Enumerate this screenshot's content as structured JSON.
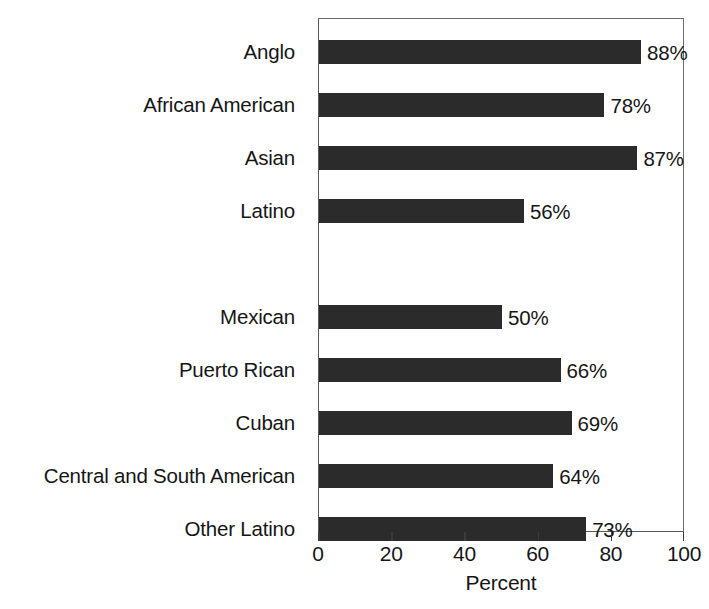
{
  "chart_data": {
    "type": "bar",
    "orientation": "horizontal",
    "title": "",
    "subtitle": "",
    "xlabel": "Percent",
    "ylabel": "",
    "xlim": [
      0,
      100
    ],
    "xticks": [
      0,
      20,
      40,
      60,
      80,
      100
    ],
    "xticklabels": [
      "0",
      "20",
      "40",
      "60",
      "80",
      "100"
    ],
    "grid": false,
    "legend": false,
    "bar_color": "#2b2b2b",
    "frame_color": "#5a5a5a",
    "text_color": "#161616",
    "categories": [
      "Anglo",
      "African American",
      "Asian",
      "Latino",
      "",
      "Mexican",
      "Puerto Rican",
      "Cuban",
      "Central and South American",
      "Other Latino"
    ],
    "values": [
      88,
      78,
      87,
      56,
      null,
      50,
      66,
      69,
      64,
      73
    ],
    "value_labels": [
      "88%",
      "78%",
      "87%",
      "56%",
      "",
      "50%",
      "66%",
      "69%",
      "64%",
      "73%"
    ],
    "rows": [
      {
        "label": "Anglo",
        "value": 88,
        "value_label": "88%",
        "slot": 0,
        "has_bar": true
      },
      {
        "label": "African American",
        "value": 78,
        "value_label": "78%",
        "slot": 1,
        "has_bar": true
      },
      {
        "label": "Asian",
        "value": 87,
        "value_label": "87%",
        "slot": 2,
        "has_bar": true
      },
      {
        "label": "Latino",
        "value": 56,
        "value_label": "56%",
        "slot": 3,
        "has_bar": true
      },
      {
        "label": "",
        "value": null,
        "value_label": "",
        "slot": 4,
        "has_bar": false
      },
      {
        "label": "Mexican",
        "value": 50,
        "value_label": "50%",
        "slot": 5,
        "has_bar": true
      },
      {
        "label": "Puerto Rican",
        "value": 66,
        "value_label": "66%",
        "slot": 6,
        "has_bar": true
      },
      {
        "label": "Cuban",
        "value": 69,
        "value_label": "69%",
        "slot": 7,
        "has_bar": true
      },
      {
        "label": "Central and South American",
        "value": 64,
        "value_label": "64%",
        "slot": 8,
        "has_bar": true
      },
      {
        "label": "Other Latino",
        "value": 73,
        "value_label": "73%",
        "slot": 9,
        "has_bar": true
      }
    ]
  }
}
